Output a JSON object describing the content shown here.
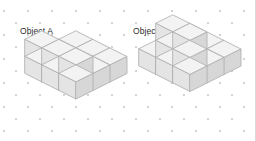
{
  "page": {
    "background_color": "#ffffff",
    "width": 256,
    "height": 141,
    "top_cutoff_text": "nnnnnnnnnnnnnnnnnnnnnnnnnnnnn"
  },
  "grid": {
    "name": "isometric-dot-paper",
    "dot_color": "#c9c9cf",
    "spacing_x": 24,
    "spacing_y": 12,
    "staggered": true
  },
  "palette": {
    "face_top": "#f3f3f3",
    "face_left": "#e4e4e4",
    "face_right": "#d7d7d7",
    "outline": "#b2b2b2",
    "label_text": "#2b2b2b"
  },
  "objects": [
    {
      "id": "A",
      "label": "Object A",
      "shape": "staircase",
      "cube_size": 17,
      "base_layers": 1,
      "base_rows": 3,
      "base_cols": 3,
      "total_cubes": 12,
      "cells": [
        {
          "x": 0,
          "y": 0,
          "z": 0
        },
        {
          "x": 1,
          "y": 0,
          "z": 0
        },
        {
          "x": 2,
          "y": 0,
          "z": 0
        },
        {
          "x": 0,
          "y": 1,
          "z": 0
        },
        {
          "x": 1,
          "y": 1,
          "z": 0
        },
        {
          "x": 2,
          "y": 1,
          "z": 0
        },
        {
          "x": 0,
          "y": 2,
          "z": 0
        },
        {
          "x": 1,
          "y": 2,
          "z": 0
        },
        {
          "x": 2,
          "y": 2,
          "z": 0
        },
        {
          "x": 0,
          "y": 2,
          "z": 1
        },
        {
          "x": 1,
          "y": 2,
          "z": 1
        },
        {
          "x": 2,
          "y": 2,
          "z": 1
        }
      ]
    },
    {
      "id": "B",
      "label": "Object B",
      "shape": "tower-on-base",
      "cube_size": 17,
      "base_layers": 1,
      "base_rows": 3,
      "base_cols": 3,
      "total_cubes": 13,
      "cells": [
        {
          "x": 0,
          "y": 0,
          "z": 0
        },
        {
          "x": 1,
          "y": 0,
          "z": 0
        },
        {
          "x": 2,
          "y": 0,
          "z": 0
        },
        {
          "x": 0,
          "y": 1,
          "z": 0
        },
        {
          "x": 1,
          "y": 1,
          "z": 0
        },
        {
          "x": 2,
          "y": 1,
          "z": 0
        },
        {
          "x": 0,
          "y": 2,
          "z": 0
        },
        {
          "x": 1,
          "y": 2,
          "z": 0
        },
        {
          "x": 2,
          "y": 2,
          "z": 0
        },
        {
          "x": 1,
          "y": 2,
          "z": 1
        },
        {
          "x": 2,
          "y": 2,
          "z": 1
        },
        {
          "x": 1,
          "y": 2,
          "z": 2
        },
        {
          "x": 2,
          "y": 2,
          "z": 2
        }
      ]
    }
  ]
}
